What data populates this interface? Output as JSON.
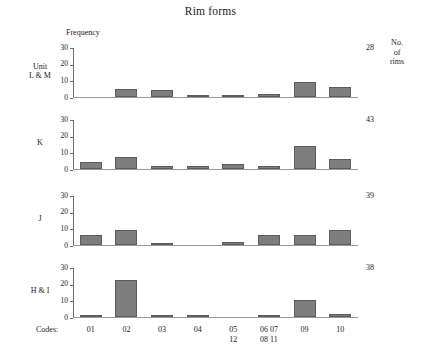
{
  "chart_data": {
    "type": "bar",
    "title": "Rim forms",
    "xlabel": "Codes:",
    "ylabel": "Frequency",
    "right_axis_label": [
      "No.",
      "of",
      "rims"
    ],
    "ylim": [
      0,
      30
    ],
    "yticks": [
      "0",
      "10",
      "20",
      "30"
    ],
    "grid": false,
    "legend": "none",
    "categories": [
      "01",
      "02",
      "03",
      "04",
      "05 12",
      "06 07 08 11",
      "09",
      "10"
    ],
    "category_lines": [
      [
        "01"
      ],
      [
        "02"
      ],
      [
        "03"
      ],
      [
        "04"
      ],
      [
        "05",
        "12"
      ],
      [
        "06 07",
        "08 11"
      ],
      [
        "09"
      ],
      [
        "10"
      ]
    ],
    "panels": [
      {
        "label_lines": [
          "Unit",
          "L & M"
        ],
        "values": [
          0,
          5,
          4,
          1,
          1,
          2,
          9,
          6
        ],
        "total": "28"
      },
      {
        "label_lines": [
          "K"
        ],
        "values": [
          4,
          7,
          2,
          2,
          3,
          2,
          14,
          6
        ],
        "total": "43"
      },
      {
        "label_lines": [
          "J"
        ],
        "values": [
          6,
          9,
          1,
          0,
          2,
          6,
          6,
          9
        ],
        "total": "39"
      },
      {
        "label_lines": [
          "H & I"
        ],
        "values": [
          1,
          22,
          1,
          1,
          0,
          1,
          10,
          2
        ],
        "total": "38"
      }
    ],
    "series": [
      {
        "name": "Unit L & M",
        "values": [
          0,
          5,
          4,
          1,
          1,
          2,
          9,
          6
        ]
      },
      {
        "name": "K",
        "values": [
          4,
          7,
          2,
          2,
          3,
          2,
          14,
          6
        ]
      },
      {
        "name": "J",
        "values": [
          6,
          9,
          1,
          0,
          2,
          6,
          6,
          9
        ]
      },
      {
        "name": "H & I",
        "values": [
          1,
          22,
          1,
          1,
          0,
          1,
          10,
          2
        ]
      }
    ],
    "colors": {
      "bar_fill": "#7d7d7d",
      "bar_stroke": "#5c5c5c",
      "axis": "#6e6e6e",
      "background": "#ffffff",
      "text": "#1a1a1a"
    }
  }
}
